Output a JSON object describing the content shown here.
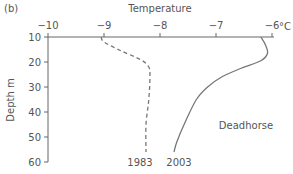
{
  "panel_label": "(b)",
  "chart_data": {
    "type": "line",
    "title": "",
    "panel": "(b)",
    "xlabel": "Temperature",
    "xunit": "°C",
    "ylabel": "Depth m",
    "x_axis_position": "top",
    "y_inverted": true,
    "xlim": [
      -10,
      -6
    ],
    "ylim": [
      10,
      60
    ],
    "xticks": [
      -10,
      -9,
      -8,
      -7,
      -6
    ],
    "xtick_labels": [
      "−10",
      "−9",
      "−8",
      "−7",
      "−6"
    ],
    "yticks": [
      10,
      20,
      30,
      40,
      50,
      60
    ],
    "ytick_labels": [
      "10",
      "20",
      "30",
      "40",
      "50",
      "60"
    ],
    "grid": false,
    "annotation": "Deadhorse",
    "series": [
      {
        "name": "1983",
        "style": "dashed",
        "points": [
          [
            -9.05,
            10
          ],
          [
            -9.0,
            12
          ],
          [
            -8.7,
            15.5
          ],
          [
            -8.35,
            19
          ],
          [
            -8.2,
            22
          ],
          [
            -8.18,
            26
          ],
          [
            -8.2,
            35
          ],
          [
            -8.25,
            45
          ],
          [
            -8.25,
            56
          ]
        ]
      },
      {
        "name": "2003",
        "style": "solid",
        "points": [
          [
            -6.2,
            10
          ],
          [
            -6.12,
            13
          ],
          [
            -6.08,
            16.5
          ],
          [
            -6.2,
            19.5
          ],
          [
            -6.55,
            22.5
          ],
          [
            -6.9,
            26
          ],
          [
            -7.15,
            30
          ],
          [
            -7.35,
            35
          ],
          [
            -7.55,
            44
          ],
          [
            -7.7,
            52
          ],
          [
            -7.75,
            56
          ]
        ]
      }
    ]
  }
}
